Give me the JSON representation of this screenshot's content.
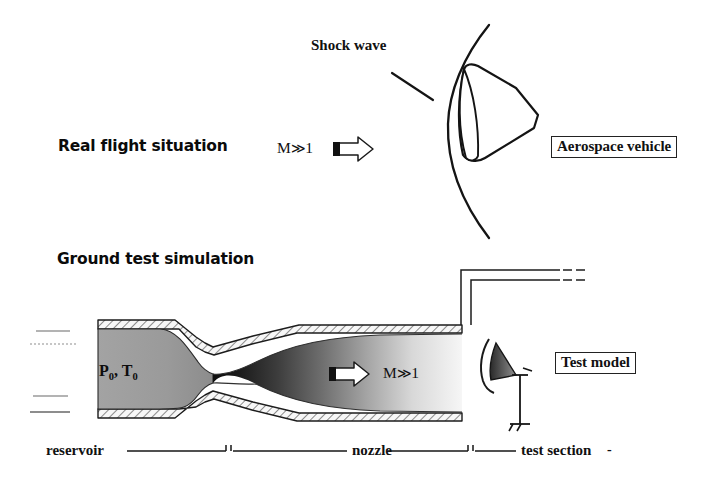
{
  "figure": {
    "title_top": "Real flight situation",
    "title_bottom": "Ground test simulation",
    "type": "technical-diagram"
  },
  "top_panel": {
    "heading": "Real flight situation",
    "mach_label": "M",
    "mach_relation": "≫",
    "mach_value": "1",
    "flow_arrow_icon": "flow-arrow-right",
    "shock_label": "Shock wave",
    "vehicle_box_label": "Aerospace vehicle"
  },
  "bottom_panel": {
    "heading": "Ground test simulation",
    "reservoir_label_p": "P",
    "reservoir_label_p_sub": "0",
    "reservoir_label_sep": ", ",
    "reservoir_label_t": "T",
    "reservoir_label_t_sub": "0",
    "mach_label": "M",
    "mach_relation": "≫",
    "mach_value": "1",
    "flow_arrow_icon": "flow-arrow-right",
    "model_box_label": "Test model",
    "station_labels": [
      "reservoir",
      "nozzle",
      "test section"
    ],
    "trailing_dash": "-"
  },
  "colors": {
    "ink": "#111111",
    "line": "#222222",
    "hatch": "#3a3a3a",
    "wall_fill": "#f2f2f2",
    "reservoir_gray": "#9a9a9a",
    "throat_dark": "#151515",
    "flow_light": "#f4f4f4",
    "background": "#ffffff",
    "faint_line": "#8d8d8d"
  }
}
